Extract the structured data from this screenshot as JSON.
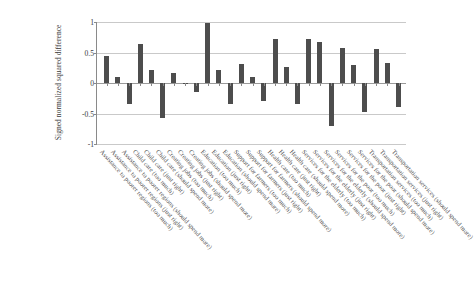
{
  "chart_data": {
    "type": "bar",
    "title": "",
    "xlabel": "",
    "ylabel": "Signed normalized squared difference",
    "ylim": [
      -1,
      1
    ],
    "yticks": [
      "1",
      "0.5",
      "0",
      "-0.5",
      "-1"
    ],
    "ytick_values": [
      1,
      0.5,
      0,
      -0.5,
      -1
    ],
    "grid": true,
    "legend": "none",
    "bar_color": "#4d4d4d",
    "categories": [
      "Assistance to poorer regions (too much)",
      "Assistance to poorer regions (just right)",
      "Assistance to poorer regions (should spend more)",
      "Child care (too much)",
      "Child care (just right)",
      "Child care (should spend more)",
      "Creating jobs (too much)",
      "Creating jobs (just right)",
      "Creating jobs (should spend more)",
      "Education (too much)",
      "Education (just right)",
      "Education (should spend more)",
      "Support for farmers (too much)",
      "Support for farmers (just right)",
      "Support for farmers (should spend more)",
      "Health care (too much)",
      "Health care (just right)",
      "Health care (should spend more)",
      "Services for the elderly (too much)",
      "Services for the elderly (just right)",
      "Services for the elderly (should spend more)",
      "Services for the poor (too much)",
      "Services for the poor (just right)",
      "Services for the poor (should spend more)",
      "Transportation services (too much)",
      "Transportation services (just right)",
      "Transportation services (should spend more)"
    ],
    "values": [
      0.45,
      0.1,
      -0.34,
      0.64,
      0.21,
      -0.57,
      0.16,
      -0.02,
      -0.15,
      0.99,
      0.22,
      -0.34,
      0.31,
      0.1,
      -0.29,
      0.72,
      0.26,
      -0.35,
      0.72,
      0.67,
      -0.71,
      0.57,
      0.3,
      -0.48,
      0.56,
      0.33,
      -0.39
    ]
  }
}
